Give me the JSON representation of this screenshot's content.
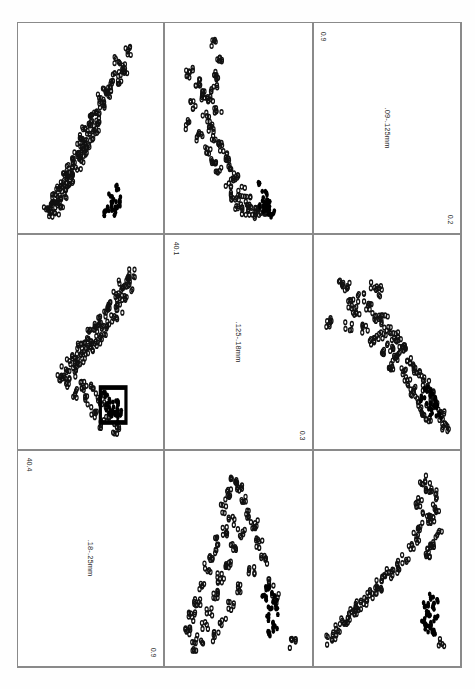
{
  "figure": {
    "type": "scatter-plot-matrix",
    "rows": 3,
    "cols": 3,
    "orientation_note": "labels rendered rotated 90 degrees",
    "marker_legend": {
      "open_circle": "open circle marker",
      "filled_circle": "filled black marker"
    },
    "highlight_box": "rectangle outline highlighting filled cluster in center-left panel"
  },
  "chart_data": {
    "type": "scatter",
    "title": "",
    "xlabel": "",
    "ylabel": "",
    "grid": false,
    "legend_position": "none",
    "variables": [
      {
        "id": "v1",
        "label": ".18-.25mm",
        "min": "0.9",
        "max": "40.4"
      },
      {
        "id": "v2",
        "label": ".125-.18mm",
        "min": "0.3",
        "max": "40.1"
      },
      {
        "id": "v3",
        "label": ".09-.125mm",
        "min": "0.2",
        "max": "0.9"
      }
    ],
    "panels": [
      {
        "row": 0,
        "col": 0,
        "kind": "scatter",
        "x_var": "v1",
        "y_var": "v3",
        "name": "panel-r0c0",
        "open_points": [
          [
            0.79,
            0.92
          ],
          [
            0.71,
            0.86
          ],
          [
            0.74,
            0.83
          ],
          [
            0.77,
            0.8
          ],
          [
            0.69,
            0.78
          ],
          [
            0.72,
            0.76
          ],
          [
            0.66,
            0.74
          ],
          [
            0.62,
            0.71
          ],
          [
            0.64,
            0.68
          ],
          [
            0.58,
            0.66
          ],
          [
            0.61,
            0.63
          ],
          [
            0.55,
            0.6
          ],
          [
            0.52,
            0.58
          ],
          [
            0.57,
            0.55
          ],
          [
            0.49,
            0.53
          ],
          [
            0.54,
            0.5
          ],
          [
            0.46,
            0.48
          ],
          [
            0.5,
            0.46
          ],
          [
            0.44,
            0.44
          ],
          [
            0.47,
            0.42
          ],
          [
            0.41,
            0.4
          ],
          [
            0.45,
            0.38
          ],
          [
            0.38,
            0.36
          ],
          [
            0.42,
            0.34
          ],
          [
            0.35,
            0.32
          ],
          [
            0.4,
            0.3
          ],
          [
            0.33,
            0.28
          ],
          [
            0.37,
            0.26
          ],
          [
            0.3,
            0.24
          ],
          [
            0.34,
            0.22
          ],
          [
            0.28,
            0.2
          ],
          [
            0.31,
            0.18
          ],
          [
            0.25,
            0.16
          ],
          [
            0.29,
            0.14
          ],
          [
            0.22,
            0.12
          ],
          [
            0.26,
            0.1
          ],
          [
            0.19,
            0.08
          ],
          [
            0.24,
            0.06
          ],
          [
            0.16,
            0.05
          ],
          [
            0.21,
            0.04
          ]
        ],
        "solid_points": [
          [
            0.7,
            0.18
          ],
          [
            0.66,
            0.13
          ],
          [
            0.73,
            0.11
          ],
          [
            0.68,
            0.09
          ],
          [
            0.64,
            0.07
          ],
          [
            0.71,
            0.06
          ],
          [
            0.67,
            0.05
          ],
          [
            0.62,
            0.04
          ]
        ]
      },
      {
        "row": 0,
        "col": 1,
        "kind": "scatter",
        "x_var": "v2",
        "y_var": "v3",
        "name": "panel-r0c1",
        "open_points": [
          [
            0.3,
            0.95
          ],
          [
            0.35,
            0.88
          ],
          [
            0.12,
            0.8
          ],
          [
            0.33,
            0.78
          ],
          [
            0.18,
            0.74
          ],
          [
            0.31,
            0.72
          ],
          [
            0.22,
            0.68
          ],
          [
            0.28,
            0.66
          ],
          [
            0.15,
            0.62
          ],
          [
            0.34,
            0.6
          ],
          [
            0.25,
            0.56
          ],
          [
            0.11,
            0.52
          ],
          [
            0.29,
            0.5
          ],
          [
            0.2,
            0.46
          ],
          [
            0.32,
            0.44
          ],
          [
            0.36,
            0.4
          ],
          [
            0.26,
            0.38
          ],
          [
            0.4,
            0.34
          ],
          [
            0.3,
            0.32
          ],
          [
            0.44,
            0.28
          ],
          [
            0.35,
            0.26
          ],
          [
            0.48,
            0.22
          ],
          [
            0.42,
            0.2
          ],
          [
            0.52,
            0.16
          ],
          [
            0.46,
            0.14
          ],
          [
            0.57,
            0.11
          ],
          [
            0.5,
            0.09
          ],
          [
            0.62,
            0.07
          ],
          [
            0.55,
            0.06
          ],
          [
            0.67,
            0.05
          ],
          [
            0.72,
            0.04
          ],
          [
            0.6,
            0.04
          ]
        ],
        "solid_points": [
          [
            0.66,
            0.2
          ],
          [
            0.7,
            0.14
          ],
          [
            0.72,
            0.11
          ],
          [
            0.68,
            0.09
          ],
          [
            0.74,
            0.07
          ],
          [
            0.71,
            0.06
          ],
          [
            0.76,
            0.05
          ],
          [
            0.73,
            0.04
          ]
        ]
      },
      {
        "row": 0,
        "col": 2,
        "kind": "diagonal-label",
        "name": "panel-diag-v3",
        "label": ".09-.125mm",
        "corner_top": "0.9",
        "corner_bottom": "0.2"
      },
      {
        "row": 1,
        "col": 0,
        "kind": "scatter",
        "x_var": "v1",
        "y_var": "v2",
        "name": "panel-r1c0",
        "open_points": [
          [
            0.82,
            0.86
          ],
          [
            0.78,
            0.82
          ],
          [
            0.74,
            0.8
          ],
          [
            0.8,
            0.78
          ],
          [
            0.7,
            0.75
          ],
          [
            0.76,
            0.73
          ],
          [
            0.66,
            0.7
          ],
          [
            0.72,
            0.68
          ],
          [
            0.62,
            0.66
          ],
          [
            0.68,
            0.64
          ],
          [
            0.58,
            0.62
          ],
          [
            0.64,
            0.6
          ],
          [
            0.54,
            0.58
          ],
          [
            0.6,
            0.56
          ],
          [
            0.5,
            0.54
          ],
          [
            0.56,
            0.52
          ],
          [
            0.46,
            0.5
          ],
          [
            0.52,
            0.48
          ],
          [
            0.42,
            0.47
          ],
          [
            0.48,
            0.45
          ],
          [
            0.38,
            0.43
          ],
          [
            0.44,
            0.41
          ],
          [
            0.34,
            0.39
          ],
          [
            0.4,
            0.37
          ],
          [
            0.3,
            0.35
          ],
          [
            0.36,
            0.33
          ],
          [
            0.26,
            0.31
          ],
          [
            0.32,
            0.29
          ],
          [
            0.44,
            0.27
          ],
          [
            0.5,
            0.25
          ],
          [
            0.38,
            0.23
          ],
          [
            0.56,
            0.21
          ],
          [
            0.46,
            0.19
          ],
          [
            0.6,
            0.17
          ],
          [
            0.52,
            0.13
          ],
          [
            0.64,
            0.1
          ],
          [
            0.58,
            0.07
          ],
          [
            0.7,
            0.04
          ]
        ],
        "solid_points": [
          [
            0.62,
            0.22
          ],
          [
            0.66,
            0.2
          ],
          [
            0.7,
            0.18
          ],
          [
            0.64,
            0.16
          ],
          [
            0.68,
            0.14
          ],
          [
            0.72,
            0.13
          ],
          [
            0.66,
            0.11
          ],
          [
            0.7,
            0.1
          ]
        ],
        "highlight_rect": {
          "x": 0.575,
          "y": 0.075,
          "w": 0.2,
          "h": 0.185
        }
      },
      {
        "row": 1,
        "col": 1,
        "kind": "diagonal-label",
        "name": "panel-diag-v2",
        "label": ".125-.18mm",
        "corner_top": "40.1",
        "corner_bottom": "0.3"
      },
      {
        "row": 1,
        "col": 2,
        "kind": "scatter",
        "x_var": "v3",
        "y_var": "v2",
        "name": "panel-r1c2",
        "open_points": [
          [
            0.14,
            0.82
          ],
          [
            0.18,
            0.79
          ],
          [
            0.4,
            0.8
          ],
          [
            0.44,
            0.77
          ],
          [
            0.3,
            0.74
          ],
          [
            0.22,
            0.7
          ],
          [
            0.36,
            0.68
          ],
          [
            0.26,
            0.66
          ],
          [
            0.42,
            0.64
          ],
          [
            0.48,
            0.62
          ],
          [
            0.05,
            0.6
          ],
          [
            0.2,
            0.58
          ],
          [
            0.33,
            0.57
          ],
          [
            0.5,
            0.56
          ],
          [
            0.44,
            0.54
          ],
          [
            0.56,
            0.53
          ],
          [
            0.38,
            0.51
          ],
          [
            0.6,
            0.5
          ],
          [
            0.52,
            0.48
          ],
          [
            0.64,
            0.46
          ],
          [
            0.46,
            0.44
          ],
          [
            0.58,
            0.42
          ],
          [
            0.68,
            0.4
          ],
          [
            0.54,
            0.38
          ],
          [
            0.72,
            0.36
          ],
          [
            0.62,
            0.34
          ],
          [
            0.76,
            0.32
          ],
          [
            0.66,
            0.29
          ],
          [
            0.8,
            0.27
          ],
          [
            0.7,
            0.24
          ],
          [
            0.84,
            0.22
          ],
          [
            0.74,
            0.19
          ],
          [
            0.88,
            0.17
          ],
          [
            0.78,
            0.14
          ],
          [
            0.92,
            0.11
          ],
          [
            0.82,
            0.08
          ],
          [
            0.95,
            0.05
          ]
        ],
        "solid_points": [
          [
            0.8,
            0.26
          ],
          [
            0.84,
            0.23
          ],
          [
            0.78,
            0.21
          ],
          [
            0.86,
            0.19
          ],
          [
            0.82,
            0.17
          ],
          [
            0.88,
            0.15
          ],
          [
            0.84,
            0.13
          ],
          [
            0.9,
            0.11
          ]
        ]
      },
      {
        "row": 2,
        "col": 0,
        "kind": "diagonal-label",
        "name": "panel-diag-v1",
        "label": ".18-.25mm",
        "corner_top": "40.4",
        "corner_bottom": "0.9"
      },
      {
        "row": 2,
        "col": 1,
        "kind": "scatter",
        "x_var": "v2",
        "y_var": "v1",
        "name": "panel-r2c1",
        "open_points": [
          [
            0.46,
            0.92
          ],
          [
            0.5,
            0.88
          ],
          [
            0.42,
            0.84
          ],
          [
            0.54,
            0.8
          ],
          [
            0.38,
            0.76
          ],
          [
            0.58,
            0.74
          ],
          [
            0.44,
            0.7
          ],
          [
            0.62,
            0.68
          ],
          [
            0.4,
            0.65
          ],
          [
            0.52,
            0.63
          ],
          [
            0.34,
            0.6
          ],
          [
            0.66,
            0.58
          ],
          [
            0.46,
            0.55
          ],
          [
            0.3,
            0.52
          ],
          [
            0.7,
            0.5
          ],
          [
            0.42,
            0.48
          ],
          [
            0.26,
            0.45
          ],
          [
            0.6,
            0.43
          ],
          [
            0.36,
            0.4
          ],
          [
            0.74,
            0.38
          ],
          [
            0.22,
            0.36
          ],
          [
            0.5,
            0.34
          ],
          [
            0.32,
            0.31
          ],
          [
            0.78,
            0.29
          ],
          [
            0.18,
            0.27
          ],
          [
            0.44,
            0.25
          ],
          [
            0.28,
            0.22
          ],
          [
            0.14,
            0.19
          ],
          [
            0.38,
            0.17
          ],
          [
            0.24,
            0.14
          ],
          [
            0.1,
            0.11
          ],
          [
            0.32,
            0.09
          ],
          [
            0.2,
            0.07
          ],
          [
            0.92,
            0.05
          ],
          [
            0.16,
            0.04
          ]
        ],
        "solid_points": [
          [
            0.72,
            0.34
          ],
          [
            0.76,
            0.32
          ],
          [
            0.7,
            0.29
          ],
          [
            0.78,
            0.27
          ],
          [
            0.74,
            0.24
          ],
          [
            0.8,
            0.22
          ],
          [
            0.72,
            0.19
          ],
          [
            0.76,
            0.16
          ],
          [
            0.78,
            0.13
          ],
          [
            0.74,
            0.11
          ]
        ]
      },
      {
        "row": 2,
        "col": 2,
        "kind": "scatter",
        "x_var": "v3",
        "y_var": "v1",
        "name": "panel-r2c2",
        "open_points": [
          [
            0.78,
            0.92
          ],
          [
            0.82,
            0.88
          ],
          [
            0.86,
            0.84
          ],
          [
            0.74,
            0.8
          ],
          [
            0.88,
            0.76
          ],
          [
            0.8,
            0.73
          ],
          [
            0.84,
            0.7
          ],
          [
            0.76,
            0.67
          ],
          [
            0.9,
            0.64
          ],
          [
            0.72,
            0.61
          ],
          [
            0.86,
            0.58
          ],
          [
            0.68,
            0.55
          ],
          [
            0.82,
            0.53
          ],
          [
            0.64,
            0.5
          ],
          [
            0.6,
            0.47
          ],
          [
            0.56,
            0.44
          ],
          [
            0.52,
            0.42
          ],
          [
            0.48,
            0.39
          ],
          [
            0.44,
            0.36
          ],
          [
            0.4,
            0.33
          ],
          [
            0.36,
            0.31
          ],
          [
            0.32,
            0.28
          ],
          [
            0.28,
            0.25
          ],
          [
            0.24,
            0.22
          ],
          [
            0.2,
            0.19
          ],
          [
            0.16,
            0.16
          ],
          [
            0.12,
            0.13
          ],
          [
            0.08,
            0.1
          ],
          [
            0.05,
            0.07
          ],
          [
            0.92,
            0.05
          ]
        ],
        "solid_points": [
          [
            0.84,
            0.3
          ],
          [
            0.88,
            0.28
          ],
          [
            0.8,
            0.26
          ],
          [
            0.86,
            0.24
          ],
          [
            0.82,
            0.21
          ],
          [
            0.88,
            0.19
          ],
          [
            0.78,
            0.17
          ],
          [
            0.84,
            0.15
          ],
          [
            0.8,
            0.13
          ],
          [
            0.86,
            0.11
          ]
        ]
      }
    ]
  }
}
